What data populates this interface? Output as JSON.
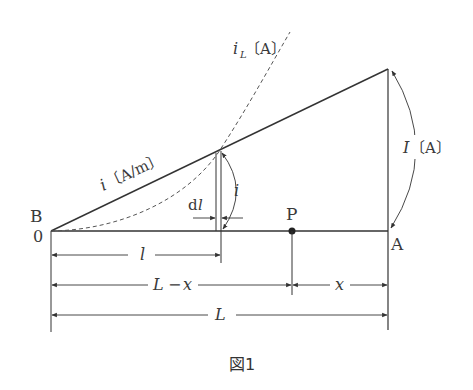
{
  "figure": {
    "caption": "図1",
    "points": {
      "B": "B",
      "origin": "0",
      "A": "A",
      "P": "P"
    },
    "labels": {
      "iL_var": "i",
      "iL_sub": "L",
      "iL_unit": "〔A〕",
      "i_density_var": "i",
      "i_density_unit": "〔A/m〕",
      "I_var": "I",
      "I_unit": "〔A〕",
      "i_small": "i",
      "dl_d": "d",
      "dl_l": "l"
    },
    "dimensions": {
      "l": "l",
      "L_minus_x_L": "L",
      "L_minus_x_op": "−",
      "L_minus_x_x": "x",
      "x": "x",
      "L": "L"
    },
    "colors": {
      "line": "#333333",
      "dashed": "#555555",
      "background": "#ffffff"
    }
  }
}
